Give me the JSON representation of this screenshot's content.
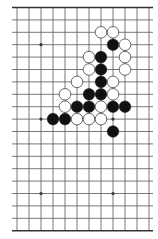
{
  "diagram": {
    "type": "go-board-fragment",
    "columns": 12,
    "rows": 19,
    "colors": {
      "background": "#ffffff",
      "line": "#555555",
      "border": "#333333",
      "black_stone": "#111111",
      "white_stone_fill": "#ffffff",
      "white_stone_stroke": "#444444"
    },
    "star_points": [
      {
        "col": 2,
        "row": 3
      },
      {
        "col": 2,
        "row": 9
      },
      {
        "col": 8,
        "row": 9
      },
      {
        "col": 2,
        "row": 15
      },
      {
        "col": 8,
        "row": 15
      }
    ],
    "stones": [
      {
        "color": "white",
        "col": 7,
        "row": 2
      },
      {
        "color": "white",
        "col": 8,
        "row": 2
      },
      {
        "color": "black",
        "col": 8,
        "row": 3
      },
      {
        "color": "white",
        "col": 9,
        "row": 3
      },
      {
        "color": "white",
        "col": 6,
        "row": 4
      },
      {
        "color": "black",
        "col": 7,
        "row": 4
      },
      {
        "color": "white",
        "col": 9,
        "row": 4
      },
      {
        "color": "white",
        "col": 6,
        "row": 5
      },
      {
        "color": "black",
        "col": 7,
        "row": 5
      },
      {
        "color": "white",
        "col": 9,
        "row": 5
      },
      {
        "color": "white",
        "col": 5,
        "row": 6
      },
      {
        "color": "black",
        "col": 7,
        "row": 6
      },
      {
        "color": "white",
        "col": 8,
        "row": 6
      },
      {
        "color": "white",
        "col": 4,
        "row": 7
      },
      {
        "color": "black",
        "col": 6,
        "row": 7
      },
      {
        "color": "black",
        "col": 7,
        "row": 7
      },
      {
        "color": "white",
        "col": 8,
        "row": 7
      },
      {
        "color": "white",
        "col": 4,
        "row": 8
      },
      {
        "color": "black",
        "col": 5,
        "row": 8
      },
      {
        "color": "black",
        "col": 6,
        "row": 8
      },
      {
        "color": "white",
        "col": 7,
        "row": 8
      },
      {
        "color": "black",
        "col": 8,
        "row": 8
      },
      {
        "color": "black",
        "col": 9,
        "row": 8
      },
      {
        "color": "black",
        "col": 3,
        "row": 9
      },
      {
        "color": "black",
        "col": 4,
        "row": 9
      },
      {
        "color": "white",
        "col": 5,
        "row": 9
      },
      {
        "color": "white",
        "col": 6,
        "row": 9
      },
      {
        "color": "white",
        "col": 7,
        "row": 9
      },
      {
        "color": "black",
        "col": 8,
        "row": 10
      }
    ]
  }
}
